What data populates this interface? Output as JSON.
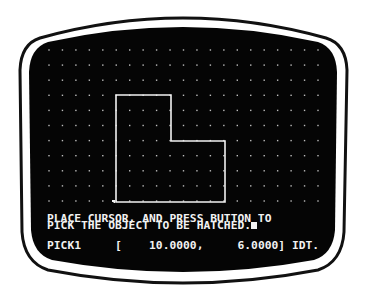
{
  "terminal": {
    "prompt_line_1": "PLACE CURSOR, AND PRESS BUTTON TO",
    "prompt_line_2": "PICK THE OBJECT TO BE HATCHED.",
    "status": {
      "mode": "PICK1",
      "open_bracket": "[",
      "x_coordinate": "10.0000,",
      "y_coordinate": "6.0000]",
      "suffix": "IDT."
    }
  },
  "drawing": {
    "grid": {
      "origin_x": 49,
      "origin_y": 50,
      "spacing_x": 13.45,
      "spacing_y": 15.1,
      "columns": 21,
      "rows": 11,
      "dot_color": "#bdbdbd"
    },
    "l_shape": {
      "points": [
        [
          116,
          95
        ],
        [
          171,
          95
        ],
        [
          171,
          141
        ],
        [
          225,
          141
        ],
        [
          225,
          202
        ],
        [
          116,
          202
        ]
      ],
      "stroke": "#f2f2f2"
    },
    "cursor": {
      "x": 114,
      "y": 202
    }
  },
  "colors": {
    "screen": "#050505",
    "bezel_face": "#ffffff",
    "bezel_line": "#111111",
    "phosphor": "#f2f2f2"
  }
}
